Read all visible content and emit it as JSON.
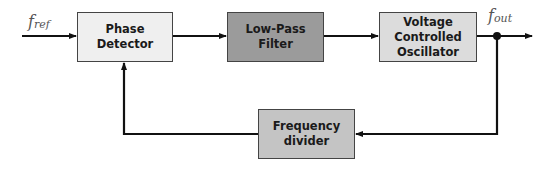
{
  "diagram": {
    "type": "block-diagram",
    "blocks": [
      {
        "id": "pd",
        "label": "Phase Detector",
        "fill": "#efefef",
        "x": 77,
        "y": 12,
        "w": 96,
        "h": 50
      },
      {
        "id": "lpf",
        "label": "Low-Pass\nFilter",
        "fill": "#9b9b9b",
        "x": 227,
        "y": 12,
        "w": 97,
        "h": 50
      },
      {
        "id": "vco",
        "label": "Voltage\nControlled\nOscillator",
        "fill": "#dcdcdc",
        "x": 379,
        "y": 12,
        "w": 98,
        "h": 50
      },
      {
        "id": "div",
        "label": "Frequency\ndivider",
        "fill": "#c4c4c4",
        "x": 258,
        "y": 109,
        "w": 97,
        "h": 50
      }
    ],
    "signals": {
      "input": {
        "base": "f",
        "sub": "ref"
      },
      "output": {
        "base": "f",
        "sub": "out"
      }
    },
    "edges": [
      {
        "from": "input",
        "to": "pd"
      },
      {
        "from": "pd",
        "to": "lpf"
      },
      {
        "from": "lpf",
        "to": "vco"
      },
      {
        "from": "vco",
        "to": "output"
      },
      {
        "from": "output",
        "to": "div"
      },
      {
        "from": "div",
        "to": "pd"
      }
    ],
    "line_color": "#111111"
  }
}
